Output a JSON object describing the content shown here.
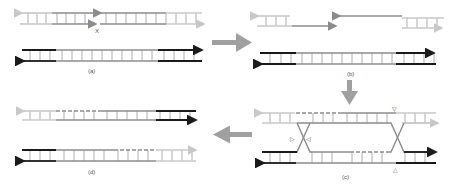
{
  "colors": {
    "light_strand": "#c8c8c8",
    "mid_strand": "#8c8c8c",
    "dark_strand": "#1a1a1a",
    "rung": "#9a9a9a",
    "step_arrow": "#a0a0a0",
    "text": "#555555"
  },
  "panels": [
    {
      "id": "a",
      "label": "(a)",
      "description": "Intact donor duplex and damaged duplex with double-strand break",
      "marker": "X"
    },
    {
      "id": "b",
      "label": "(b)",
      "description": "Break resected, 3' single-stranded overhangs"
    },
    {
      "id": "c",
      "label": "(c)",
      "description": "Strand invasion forming double Holliday junction",
      "markers": [
        "▽",
        "▷",
        "◁",
        "△"
      ]
    },
    {
      "id": "d",
      "label": "(d)",
      "description": "Resolved recombinant duplexes with patched regions"
    }
  ],
  "arrows": [
    {
      "from": "a",
      "to": "b",
      "direction": "right",
      "icon": "right-arrow-icon"
    },
    {
      "from": "b",
      "to": "c",
      "direction": "down",
      "icon": "down-arrow-icon"
    },
    {
      "from": "c",
      "to": "d",
      "direction": "left",
      "icon": "left-arrow-icon"
    }
  ]
}
